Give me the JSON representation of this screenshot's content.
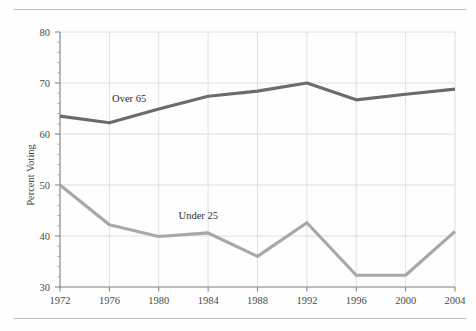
{
  "figure": {
    "name": "voter-turnout-by-age-chart"
  },
  "chart_data": {
    "type": "line",
    "title": "",
    "xlabel": "",
    "ylabel": "Percent Voting",
    "categories": [
      "1972",
      "1976",
      "1980",
      "1984",
      "1988",
      "1992",
      "1996",
      "2000",
      "2004"
    ],
    "x": [
      1972,
      1976,
      1980,
      1984,
      1988,
      1992,
      1996,
      2000,
      2004
    ],
    "xlim": [
      1972,
      2004
    ],
    "ylim": [
      30,
      80
    ],
    "yticks": [
      30,
      40,
      50,
      60,
      70,
      80
    ],
    "ytick_labels": [
      "30",
      "40",
      "50",
      "60",
      "70",
      "80"
    ],
    "grid": true,
    "legend": "inline-labels",
    "series": [
      {
        "name": "Over 65",
        "color": "#6b6b6b",
        "values": [
          63.5,
          62.2,
          64.9,
          67.4,
          68.4,
          70.0,
          66.7,
          67.8,
          68.8
        ],
        "label_position": {
          "x": 1977.6,
          "y": 66.2
        }
      },
      {
        "name": "Under 25",
        "color": "#a8a8a8",
        "values": [
          50.0,
          42.2,
          39.9,
          40.6,
          36.0,
          42.6,
          32.3,
          32.3,
          40.9
        ],
        "label_position": {
          "x": 1983.2,
          "y": 43.4
        }
      }
    ]
  }
}
